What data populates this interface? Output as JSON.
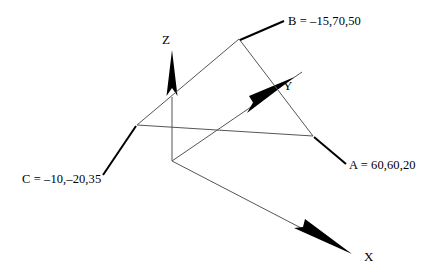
{
  "diagram": {
    "background_color": "#ffffff",
    "line_color": "#555555",
    "leader_color": "#000000",
    "arrow_color": "#000000",
    "axes": [
      {
        "name": "z-axis",
        "label": "Z",
        "direction": "up"
      },
      {
        "name": "y-axis",
        "label": "Y",
        "direction": "up-right"
      },
      {
        "name": "x-axis",
        "label": "X",
        "direction": "down-right"
      }
    ],
    "axis_labels": {
      "z": "Z",
      "y": "Y",
      "x": "X"
    },
    "points": [
      {
        "name": "A",
        "label": "A = 60,60,20",
        "coords": [
          60,
          60,
          20
        ]
      },
      {
        "name": "B",
        "label": "B = –15,70,50",
        "coords": [
          -15,
          70,
          50
        ]
      },
      {
        "name": "C",
        "label": "C = –10,–20,35",
        "coords": [
          -10,
          -20,
          35
        ]
      }
    ],
    "point_labels": {
      "a": "A = 60,60,20",
      "b": "B = –15,70,50",
      "c": "C = –10,–20,35"
    },
    "origin": {
      "x": 172,
      "y": 161
    }
  }
}
